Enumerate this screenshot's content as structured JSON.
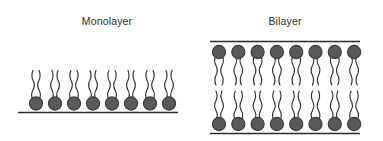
{
  "figure": {
    "background_color": "#ffffff",
    "width": 383,
    "height": 141
  },
  "style": {
    "head_fill": "#595959",
    "head_stroke": "#3a3a3a",
    "tail_stroke": "#2f2f2f",
    "surface_line_color": "#2b2b2b",
    "label_color": "#2b2b2b"
  },
  "panels": [
    {
      "id": "monolayer",
      "label": "Monolayer",
      "label_x": 107,
      "label_y": 25,
      "lipid_count": 8,
      "arrangement": "single-leaflet",
      "head_orientation": "down",
      "tail_orientation": "up",
      "head_radius": 6.6,
      "first_head_x": 36,
      "head_spacing": 19,
      "head_center_y": 103.5,
      "tail_length": 33,
      "tails_per_lipid": 2,
      "surface_lines": [
        {
          "name": "base-line",
          "x1": 18,
          "x2": 178,
          "y": 112.5
        }
      ]
    },
    {
      "id": "bilayer",
      "label": "Bilayer",
      "label_x": 285,
      "label_y": 25,
      "lipid_count": 8,
      "arrangement": "two-leaflets",
      "head_radius": 6.6,
      "first_head_x": 219,
      "head_spacing": 19.3,
      "upper_head_center_y": 52,
      "lower_head_center_y": 124,
      "upper_tail_end_y": 85,
      "lower_tail_end_y": 91,
      "tails_per_lipid": 2,
      "surface_lines": [
        {
          "name": "top-line",
          "x1": 210,
          "x2": 360,
          "y": 41.5
        },
        {
          "name": "bottom-line",
          "x1": 210,
          "x2": 360,
          "y": 133.5
        }
      ]
    }
  ]
}
